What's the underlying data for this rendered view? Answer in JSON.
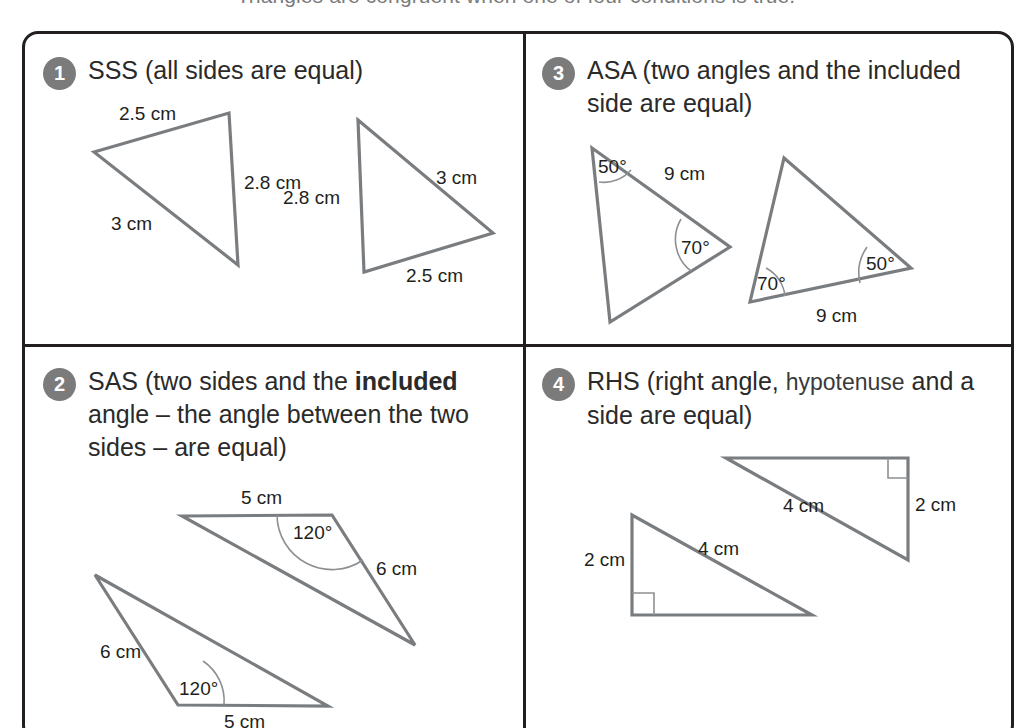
{
  "intro": {
    "text": "Triangles are congruent when one of four conditions is true."
  },
  "panels": [
    {
      "number": "1",
      "title_plain": "SSS (all sides are equal)",
      "title_parts": [
        {
          "text": "SSS (all sides are equal)",
          "style": "normal"
        }
      ],
      "figures": [
        {
          "name": "triangle-sss-left",
          "labels": [
            "2.5 cm",
            "2.8 cm",
            "3 cm"
          ]
        },
        {
          "name": "triangle-sss-right",
          "labels": [
            "3 cm",
            "2.8 cm",
            "2.5 cm"
          ]
        }
      ]
    },
    {
      "number": "2",
      "title_plain": "SAS (two sides and the included angle – the angle between the two sides – are equal)",
      "title_parts": [
        {
          "text": "SAS (two sides and the ",
          "style": "normal"
        },
        {
          "text": "included",
          "style": "bold"
        },
        {
          "text": " angle – the angle between the two sides – are equal)",
          "style": "normal"
        }
      ],
      "figures": [
        {
          "name": "triangle-sas-upper",
          "labels": [
            "5 cm",
            "120°",
            "6 cm"
          ]
        },
        {
          "name": "triangle-sas-lower",
          "labels": [
            "6 cm",
            "120°",
            "5 cm"
          ]
        }
      ]
    },
    {
      "number": "3",
      "title_plain": "ASA (two angles and the included side are equal)",
      "title_parts": [
        {
          "text": "ASA (two angles and the included side are equal)",
          "style": "normal"
        }
      ],
      "figures": [
        {
          "name": "triangle-asa-left",
          "labels": [
            "50°",
            "9 cm",
            "70°"
          ]
        },
        {
          "name": "triangle-asa-right",
          "labels": [
            "70°",
            "50°",
            "9 cm"
          ]
        }
      ]
    },
    {
      "number": "4",
      "title_plain": "RHS (right angle, hypotenuse and a side are equal)",
      "title_parts": [
        {
          "text": "RHS (right angle, ",
          "style": "normal"
        },
        {
          "text": "hypotenuse",
          "style": "lighter"
        },
        {
          "text": " and a side are equal)",
          "style": "normal"
        }
      ],
      "figures": [
        {
          "name": "triangle-rhs-upper",
          "labels": [
            "2 cm",
            "4 cm"
          ]
        },
        {
          "name": "triangle-rhs-lower",
          "labels": [
            "2 cm",
            "4 cm"
          ]
        }
      ]
    }
  ],
  "figure_labels": {
    "p1": {
      "a_25": "2.5 cm",
      "a_28": "2.8 cm",
      "a_3": "3 cm",
      "b_3": "3 cm",
      "b_28": "2.8 cm",
      "b_25": "2.5 cm"
    },
    "p2": {
      "a_5": "5 cm",
      "a_120": "120°",
      "a_6": "6 cm",
      "b_6": "6 cm",
      "b_120": "120°",
      "b_5": "5 cm"
    },
    "p3": {
      "a_50": "50°",
      "a_9": "9 cm",
      "a_70": "70°",
      "b_70": "70°",
      "b_50": "50°",
      "b_9": "9 cm"
    },
    "p4": {
      "a_2": "2 cm",
      "a_4": "4 cm",
      "b_2": "2 cm",
      "b_4": "4 cm"
    }
  },
  "colors": {
    "frame_stroke": "#231f20",
    "badge_fill": "#7b7b7b",
    "badge_text": "#ffffff",
    "triangle_stroke": "#7a7d80",
    "arc_stroke": "#8d9093",
    "text": "#231f20",
    "background": "#ffffff"
  }
}
